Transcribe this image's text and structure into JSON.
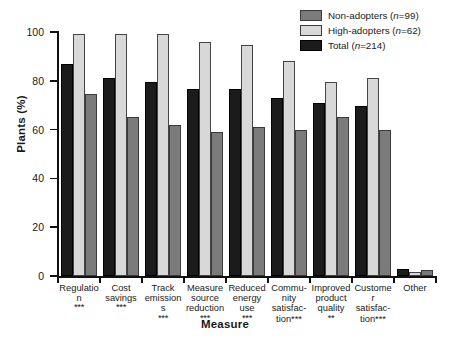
{
  "chart_data": {
    "type": "bar",
    "title": "",
    "xlabel": "Measure",
    "ylabel": "Plants (%)",
    "ylim": [
      0,
      100
    ],
    "yticks": [
      0,
      20,
      40,
      60,
      80,
      100
    ],
    "grid": false,
    "legend_position": "top-right",
    "categories": [
      "Regulation",
      "Cost savings",
      "Track emissions",
      "Measure source reduction",
      "Community satisfaction",
      "Reduced energy use",
      "Improved product quality",
      "Customer satisfaction",
      "Other"
    ],
    "category_labels": [
      {
        "lines": [
          "Regulation"
        ],
        "significance": "***"
      },
      {
        "lines": [
          "Cost",
          "savings"
        ],
        "significance": "***"
      },
      {
        "lines": [
          "Track",
          "emissions"
        ],
        "significance": "***"
      },
      {
        "lines": [
          "Measure",
          "source",
          "reduction"
        ],
        "significance": "***"
      },
      {
        "lines": [
          "Reduced",
          "energy",
          "use"
        ],
        "significance": "***"
      },
      {
        "lines": [
          "Commu-",
          "nity",
          "satisfac-",
          "tion***"
        ],
        "significance": ""
      },
      {
        "lines": [
          "Improved",
          "product",
          "quality"
        ],
        "significance": "**"
      },
      {
        "lines": [
          "Customer",
          "satisfac-",
          "tion***"
        ],
        "significance": ""
      },
      {
        "lines": [
          "Other"
        ],
        "significance": ""
      }
    ],
    "plot_series_order": [
      "Total",
      "High-adopters",
      "Non-adopters"
    ],
    "series": [
      {
        "name": "Non-adopters",
        "legend_label": "Non-adopters (n=99)",
        "n": 99,
        "color": "#7b7b7b",
        "values": [
          74.5,
          65,
          62,
          59,
          61,
          60,
          65,
          60,
          2.5
        ]
      },
      {
        "name": "High-adopters",
        "legend_label": "High-adopters (n=62)",
        "n": 62,
        "color": "#d8d8d8",
        "values": [
          99,
          99,
          99,
          96,
          94.5,
          88,
          79.5,
          81,
          1.5
        ]
      },
      {
        "name": "Total",
        "legend_label": "Total (n=214)",
        "n": 214,
        "color": "#1b1b1b",
        "values": [
          87,
          81,
          79.5,
          76.5,
          76.5,
          73,
          71,
          69.5,
          3
        ]
      }
    ]
  },
  "legend": {
    "items": [
      {
        "label_main": "Non-adopters",
        "label_n": "(n=99)",
        "swatch": "non"
      },
      {
        "label_main": "High-adopters",
        "label_n": "(n=62)",
        "swatch": "high"
      },
      {
        "label_main": "Total",
        "label_n": "(n=214)",
        "swatch": "total"
      }
    ]
  }
}
